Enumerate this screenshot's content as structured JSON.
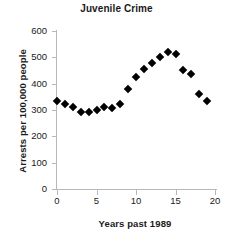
{
  "chart_data": {
    "type": "scatter",
    "title": "Juvenile Crime",
    "xlabel": "Years past 1989",
    "ylabel": "Arrests per 100,000 people",
    "xlim": [
      0,
      20
    ],
    "ylim": [
      0,
      600
    ],
    "grid": false,
    "legend": null,
    "marker": "filled-diamond",
    "marker_color": "#000000",
    "axis_color": "#b8b8b8",
    "xticks": [
      0,
      5,
      10,
      15,
      20
    ],
    "xtick_labels": [
      "0",
      "5",
      "10",
      "15",
      "20"
    ],
    "yticks": [
      0,
      100,
      200,
      300,
      400,
      500,
      600
    ],
    "ytick_labels": [
      "0",
      "100",
      "200",
      "300",
      "400",
      "500",
      "600"
    ],
    "x": [
      0,
      1,
      2,
      3,
      4,
      5,
      6,
      7,
      8,
      9,
      10,
      11,
      12,
      13,
      14,
      15,
      16,
      17,
      18,
      19
    ],
    "values": [
      333,
      322,
      313,
      294,
      294,
      300,
      313,
      308,
      324,
      378,
      424,
      456,
      477,
      500,
      520,
      512,
      453,
      437,
      362,
      333
    ],
    "points": [
      {
        "x": 0,
        "y": 333
      },
      {
        "x": 1,
        "y": 322
      },
      {
        "x": 2,
        "y": 313
      },
      {
        "x": 3,
        "y": 294
      },
      {
        "x": 4,
        "y": 294
      },
      {
        "x": 5,
        "y": 300
      },
      {
        "x": 6,
        "y": 313
      },
      {
        "x": 7,
        "y": 308
      },
      {
        "x": 8,
        "y": 324
      },
      {
        "x": 9,
        "y": 378
      },
      {
        "x": 10,
        "y": 424
      },
      {
        "x": 11,
        "y": 456
      },
      {
        "x": 12,
        "y": 477
      },
      {
        "x": 13,
        "y": 500
      },
      {
        "x": 14,
        "y": 520
      },
      {
        "x": 15,
        "y": 512
      },
      {
        "x": 16,
        "y": 453
      },
      {
        "x": 17,
        "y": 437
      },
      {
        "x": 18,
        "y": 362
      },
      {
        "x": 19,
        "y": 333
      }
    ]
  }
}
